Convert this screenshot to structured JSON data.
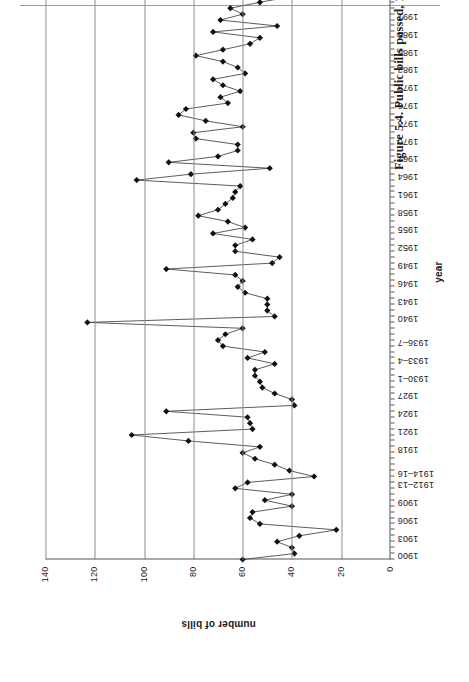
{
  "page": {
    "caption": "Figure 5.4. Public bills passed, 1900–97",
    "rule_present": true
  },
  "chart_data": {
    "type": "line",
    "title": "Public bills passed, 1900–97",
    "xlabel": "year",
    "ylabel": "number of bills",
    "ylim": [
      0,
      140
    ],
    "ytick_labels": [
      "0",
      "20",
      "40",
      "60",
      "80",
      "100",
      "120",
      "140"
    ],
    "ytick_values": [
      0,
      20,
      40,
      60,
      80,
      100,
      120,
      140
    ],
    "grid": "horizontal",
    "legend": "none",
    "marker": "filled-diamond",
    "xtick_labels": [
      "1900",
      "1903",
      "1906",
      "1909",
      "1912–13",
      "1914–16",
      "1918",
      "1921",
      "1924",
      "1927",
      "1930–1",
      "1933–4",
      "1936–7",
      "1940",
      "1943",
      "1946",
      "1949",
      "1952",
      "1955",
      "1958",
      "1961",
      "1964",
      "1967",
      "1970",
      "1973",
      "1976",
      "1979",
      "1982",
      "1985",
      "1988",
      "1991",
      "1995"
    ],
    "xtick_indices": [
      0,
      3,
      6,
      9,
      12,
      14,
      18,
      21,
      24,
      27,
      30,
      33,
      36,
      40,
      43,
      46,
      49,
      52,
      55,
      58,
      61,
      64,
      67,
      70,
      73,
      76,
      79,
      82,
      85,
      88,
      91,
      95
    ],
    "x": [
      1900,
      1901,
      1902,
      1903,
      1904,
      1905,
      1906,
      1907,
      1908,
      1909,
      1910,
      1911,
      1912,
      1913,
      1914,
      1915,
      1916,
      1917,
      1918,
      1919,
      1920,
      1921,
      1922,
      1923,
      1924,
      1925,
      1926,
      1927,
      1928,
      1929,
      1930,
      1931,
      1932,
      1933,
      1934,
      1935,
      1936,
      1937,
      1938,
      1939,
      1940,
      1941,
      1942,
      1943,
      1944,
      1945,
      1946,
      1947,
      1948,
      1949,
      1950,
      1951,
      1952,
      1953,
      1954,
      1955,
      1956,
      1957,
      1958,
      1959,
      1960,
      1961,
      1962,
      1963,
      1964,
      1965,
      1966,
      1967,
      1968,
      1969,
      1970,
      1971,
      1972,
      1973,
      1974,
      1975,
      1976,
      1977,
      1978,
      1979,
      1980,
      1981,
      1982,
      1983,
      1984,
      1985,
      1986,
      1987,
      1988,
      1989,
      1990,
      1991,
      1992,
      1993,
      1994,
      1995,
      1996,
      1997
    ],
    "values": [
      60,
      39,
      40,
      46,
      37,
      22,
      53,
      57,
      56,
      40,
      51,
      40,
      63,
      58,
      31,
      41,
      47,
      55,
      60,
      53,
      82,
      105,
      56,
      57,
      58,
      91,
      39,
      40,
      47,
      52,
      53,
      55,
      55,
      47,
      58,
      51,
      68,
      70,
      67,
      60,
      123,
      47,
      50,
      50,
      50,
      59,
      62,
      60,
      63,
      91,
      48,
      45,
      63,
      63,
      56,
      72,
      59,
      66,
      78,
      70,
      67,
      64,
      63,
      61,
      103,
      81,
      49,
      90,
      70,
      62,
      62,
      79,
      80,
      60,
      75,
      86,
      83,
      66,
      69,
      61,
      68,
      72,
      59,
      62,
      68,
      79,
      68,
      57,
      53,
      72,
      46,
      69,
      60,
      65,
      53,
      40,
      63,
      69
    ],
    "data_source_note": ""
  }
}
